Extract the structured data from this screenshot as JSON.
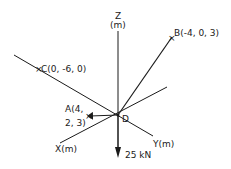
{
  "diagram": {
    "type": "3d force system",
    "axes": {
      "z": {
        "label_line1": "Z",
        "label_line2": "(m)"
      },
      "x": {
        "label": "X(m)"
      },
      "y": {
        "label": "Y(m)"
      }
    },
    "origin_label": "D",
    "points": [
      {
        "id": "A",
        "label_line1": "A(4,",
        "label_line2": "2, 3)",
        "coords": [
          4,
          2,
          3
        ]
      },
      {
        "id": "B",
        "label": "B(-4, 0, 3)",
        "coords": [
          -4,
          0,
          3
        ]
      },
      {
        "id": "C",
        "label": "C(0, -6, 0)",
        "coords": [
          0,
          -6,
          0
        ]
      }
    ],
    "load": {
      "label": "25 kN",
      "direction": "down"
    },
    "colors": {
      "line": "#1a1a1a",
      "background": "#ffffff"
    }
  }
}
